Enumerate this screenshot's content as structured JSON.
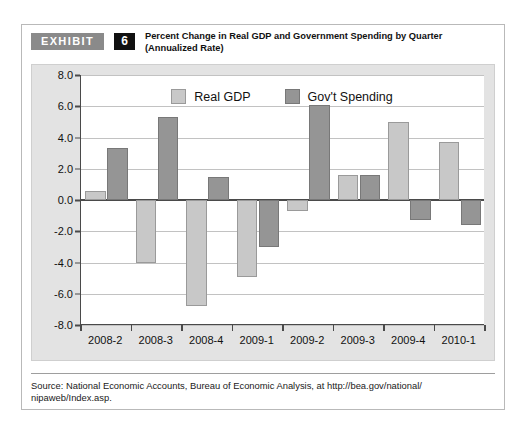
{
  "exhibit": {
    "tag_label": "EXHIBIT",
    "number": "6",
    "title_line1": "Percent Change in Real GDP and Government Spending by Quarter",
    "title_line2": "(Annualized Rate)"
  },
  "source": {
    "line1": "Source: National Economic Accounts, Bureau of Economic Analysis, at http://bea.gov/national/",
    "line2": "nipaweb/Index.asp."
  },
  "colors": {
    "gdp_bar": "#c8c8c8",
    "gov_bar": "#959595",
    "panel_background": "#e3e3e3",
    "plot_background": "#ffffff",
    "axis": "#4a4a4a",
    "gridline": "#c2c2c2",
    "tag_background": "#8a8a8a",
    "number_background": "#111111"
  },
  "chart_data": {
    "type": "bar",
    "title": "Percent Change in Real GDP and Government Spending by Quarter (Annualized Rate)",
    "xlabel": "",
    "ylabel": "",
    "ylim": [
      -8.0,
      8.0
    ],
    "ytick_step": 2.0,
    "yticks": [
      "8.0",
      "6.0",
      "4.0",
      "2.0",
      "0.0",
      "-2.0",
      "-4.0",
      "-6.0",
      "-8.0"
    ],
    "ytick_values": [
      8.0,
      6.0,
      4.0,
      2.0,
      0.0,
      -2.0,
      -4.0,
      -6.0,
      -8.0
    ],
    "grid": true,
    "legend_position": "top-center",
    "categories": [
      "2008-2",
      "2008-3",
      "2008-4",
      "2009-1",
      "2009-2",
      "2009-3",
      "2009-4",
      "2010-1"
    ],
    "series": [
      {
        "name": "Real GDP",
        "color": "#c8c8c8",
        "values": [
          0.6,
          -4.0,
          -6.8,
          -4.9,
          -0.7,
          1.6,
          5.0,
          3.7
        ]
      },
      {
        "name": "Gov't Spending",
        "color": "#959595",
        "values": [
          3.3,
          5.3,
          1.5,
          -3.0,
          6.1,
          1.6,
          -1.3,
          -1.6
        ]
      }
    ]
  }
}
